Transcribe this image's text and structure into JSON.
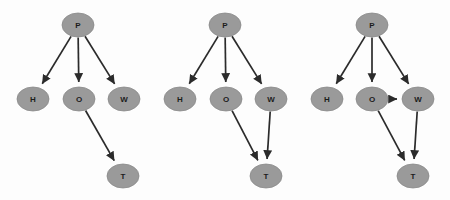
{
  "figure": {
    "type": "directed-acyclic-graph-set",
    "panel_count": 3,
    "background_color": "#fdfdfd",
    "node_fill_color": "#9a9a9a",
    "node_stroke_color": "#8a8a8a",
    "edge_color": "#2b2b2b",
    "label_color": "#1c1c1c",
    "node_radius_x": 16,
    "node_radius_y": 12,
    "arrowhead_size": 6
  },
  "panels": [
    {
      "id": "graph-1",
      "name": "graph-panel-1",
      "nodes": [
        {
          "id": "P",
          "label": "P",
          "x": 78,
          "y": 25
        },
        {
          "id": "H",
          "label": "H",
          "x": 33,
          "y": 99
        },
        {
          "id": "O",
          "label": "O",
          "x": 79,
          "y": 99
        },
        {
          "id": "W",
          "label": "W",
          "x": 124,
          "y": 99
        },
        {
          "id": "T",
          "label": "T",
          "x": 123,
          "y": 176
        }
      ],
      "edges": [
        {
          "from": "P",
          "to": "H"
        },
        {
          "from": "P",
          "to": "O"
        },
        {
          "from": "P",
          "to": "W"
        },
        {
          "from": "O",
          "to": "T"
        }
      ]
    },
    {
      "id": "graph-2",
      "name": "graph-panel-2",
      "nodes": [
        {
          "id": "P",
          "label": "P",
          "x": 225,
          "y": 25
        },
        {
          "id": "H",
          "label": "H",
          "x": 180,
          "y": 99
        },
        {
          "id": "O",
          "label": "O",
          "x": 226,
          "y": 99
        },
        {
          "id": "W",
          "label": "W",
          "x": 271,
          "y": 99
        },
        {
          "id": "T",
          "label": "T",
          "x": 266,
          "y": 176
        }
      ],
      "edges": [
        {
          "from": "P",
          "to": "H"
        },
        {
          "from": "P",
          "to": "O"
        },
        {
          "from": "P",
          "to": "W"
        },
        {
          "from": "O",
          "to": "T"
        },
        {
          "from": "W",
          "to": "T"
        }
      ]
    },
    {
      "id": "graph-3",
      "name": "graph-panel-3",
      "nodes": [
        {
          "id": "P",
          "label": "P",
          "x": 372,
          "y": 25
        },
        {
          "id": "H",
          "label": "H",
          "x": 327,
          "y": 99
        },
        {
          "id": "O",
          "label": "O",
          "x": 372,
          "y": 99
        },
        {
          "id": "W",
          "label": "W",
          "x": 418,
          "y": 99
        },
        {
          "id": "T",
          "label": "T",
          "x": 413,
          "y": 176
        }
      ],
      "edges": [
        {
          "from": "P",
          "to": "H"
        },
        {
          "from": "P",
          "to": "O"
        },
        {
          "from": "P",
          "to": "W"
        },
        {
          "from": "O",
          "to": "W"
        },
        {
          "from": "O",
          "to": "T"
        },
        {
          "from": "W",
          "to": "T"
        }
      ]
    }
  ]
}
